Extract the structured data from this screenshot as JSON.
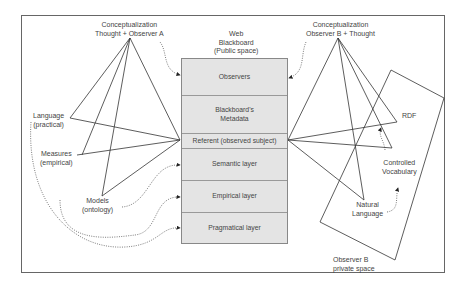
{
  "diagram": {
    "observer_a": {
      "apex_label_line1": "Conceptualization",
      "apex_label_line2": "Thought + Observer A",
      "nodes": [
        {
          "line1": "Language",
          "line2": "(practical)"
        },
        {
          "line1": "Measures",
          "line2": "(empirical)"
        },
        {
          "line1": "Models",
          "line2": "(ontology)"
        }
      ]
    },
    "blackboard": {
      "title_line1": "Web",
      "title_line2": "Blackboard",
      "title_line3": "(Public space)",
      "layers": [
        {
          "line1": "Observers",
          "line2": ""
        },
        {
          "line1": "Blackboard's",
          "line2": "Metadata"
        },
        {
          "line1": "Referent (observed subject)",
          "line2": ""
        },
        {
          "line1": "Semantic layer",
          "line2": ""
        },
        {
          "line1": "Empirical layer",
          "line2": ""
        },
        {
          "line1": "Pragmatical layer",
          "line2": ""
        }
      ]
    },
    "observer_b": {
      "apex_label_line1": "Conceptualization",
      "apex_label_line2": "Observer B + Thought",
      "nodes": [
        {
          "line1": "RDF",
          "line2": ""
        },
        {
          "line1": "Controlled",
          "line2": "Vocabulary"
        },
        {
          "line1": "Natural",
          "line2": "Language"
        }
      ],
      "private_space_line1": "Observer B",
      "private_space_line2": "private space"
    },
    "colors": {
      "line": "#333333",
      "layer_fill": "#e4e4e4",
      "layer_border": "#999999",
      "frame": "#666666"
    }
  }
}
